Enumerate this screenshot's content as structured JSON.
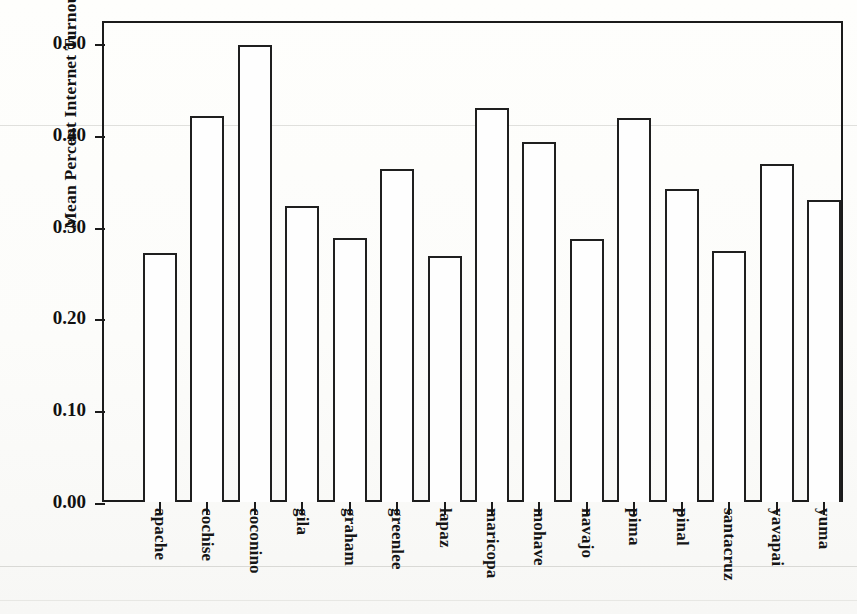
{
  "chart_data": {
    "type": "bar",
    "title": "",
    "subtitle": "",
    "xlabel": "",
    "ylabel": "Mean Percent Internet Turnout",
    "ylim": [
      0.0,
      0.52
    ],
    "yticks": [
      "0.00",
      "0.10",
      "0.20",
      "0.30",
      "0.40",
      "0.50"
    ],
    "ytick_values": [
      0.0,
      0.1,
      0.2,
      0.3,
      0.4,
      0.5
    ],
    "grid": false,
    "legend": false,
    "legend_position": "none",
    "bar_fill_color": "#ffffff",
    "bar_edge_color": "#1f1f1f",
    "axis_color": "#1b1b1b",
    "background_color": "#fdfdfb",
    "categories": [
      "apache",
      "cochise",
      "coconino",
      "gila",
      "graham",
      "greenlee",
      "lapaz",
      "maricopa",
      "mohave",
      "navajo",
      "pima",
      "pinal",
      "santacruz",
      "yavapai",
      "yuma"
    ],
    "values": [
      0.271,
      0.421,
      0.498,
      0.322,
      0.288,
      0.363,
      0.268,
      0.429,
      0.392,
      0.286,
      0.418,
      0.341,
      0.273,
      0.368,
      0.329
    ]
  }
}
